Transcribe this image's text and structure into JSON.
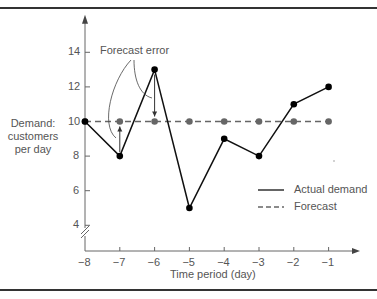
{
  "chart_data": {
    "type": "line",
    "title": "",
    "xlabel": "Time period (day)",
    "ylabel_lines": [
      "Demand:",
      "customers",
      "per day"
    ],
    "x": [
      -8,
      -7,
      -6,
      -5,
      -4,
      -3,
      -2,
      -1
    ],
    "x_ticks": [
      "−8",
      "−7",
      "−6",
      "−5",
      "−4",
      "−3",
      "−2",
      "−1"
    ],
    "y_ticks": [
      "4",
      "6",
      "8",
      "10",
      "12",
      "14"
    ],
    "y_tick_values": [
      4,
      6,
      8,
      10,
      12,
      14
    ],
    "ylim": [
      2.5,
      16
    ],
    "xlim": [
      -8,
      -0.2
    ],
    "grid": false,
    "y_axis_break": true,
    "series": [
      {
        "name": "Actual demand",
        "style": "solid",
        "color": "#111111",
        "marker_color": "#000000",
        "values": [
          10,
          8,
          13,
          5,
          9,
          8,
          11,
          12
        ]
      },
      {
        "name": "Forecast",
        "style": "dashed",
        "color": "#666666",
        "marker_color": "#666666",
        "values": [
          10,
          10,
          10,
          10,
          10,
          10,
          10,
          10
        ]
      }
    ],
    "legend": {
      "position": "right-middle",
      "entries": [
        "Actual demand",
        "Forecast"
      ]
    },
    "annotations": [
      {
        "text": "Forecast error",
        "points_to": [
          [
            -7,
            8,
            10
          ],
          [
            -6,
            13,
            10
          ]
        ]
      }
    ]
  }
}
